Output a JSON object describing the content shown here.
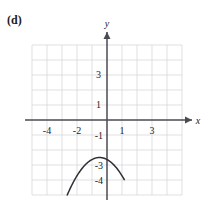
{
  "figure": {
    "part_label": "(d)",
    "x_axis_name": "x",
    "y_axis_name": "y"
  },
  "chart_data": {
    "type": "line",
    "title": "",
    "subtitle": "",
    "xlabel": "x",
    "ylabel": "y",
    "xlim": [
      -5,
      5
    ],
    "ylim": [
      -5,
      5
    ],
    "grid": true,
    "grid_step": 1,
    "legend": "none",
    "x_tick_labels": [
      "-4",
      "-2",
      "1",
      "3"
    ],
    "x_tick_values": [
      -4,
      -2,
      1,
      3
    ],
    "y_tick_labels": [
      "3",
      "1",
      "-1",
      "-3",
      "-4"
    ],
    "y_tick_values": [
      3,
      1,
      -1,
      -3,
      -4
    ],
    "series": [
      {
        "name": "parabola",
        "shape": "downward-parabola",
        "vertex": [
          -0.5,
          -2.5
        ],
        "equation": "y = -4(x + 0.5)^2 - 2.5",
        "x": [
          -2.65,
          -2.4,
          -2.1,
          -1.8,
          -1.5,
          -1.2,
          -0.9,
          -0.7,
          -0.5,
          -0.3,
          -0.1,
          0.2,
          0.4,
          0.6,
          0.8,
          1.0,
          1.15
        ],
        "y": [
          -5.0,
          -4.1,
          -3.3,
          -2.9,
          -2.6,
          -2.5,
          -2.6,
          -2.6,
          -2.5,
          -2.6,
          -2.7,
          -3.0,
          -3.3,
          -3.7,
          -4.2,
          -4.8,
          -5.0
        ]
      }
    ]
  }
}
